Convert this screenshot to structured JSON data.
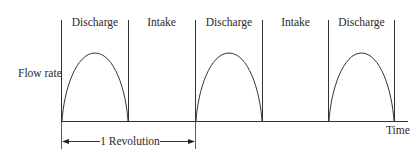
{
  "diagram": {
    "type": "pump-flow-rate-vs-time",
    "y_axis_label": "Flow rate",
    "x_axis_label": "Time",
    "phases": [
      {
        "label": "Discharge",
        "has_curve": true
      },
      {
        "label": "Intake",
        "has_curve": false
      },
      {
        "label": "Discharge",
        "has_curve": true
      },
      {
        "label": "Intake",
        "has_curve": false
      },
      {
        "label": "Discharge",
        "has_curve": true
      }
    ],
    "dimension": {
      "label": "1 Revolution",
      "span_phases": 2
    },
    "colors": {
      "line": "#333333",
      "text": "#2a2a2a",
      "background": "#ffffff"
    }
  }
}
